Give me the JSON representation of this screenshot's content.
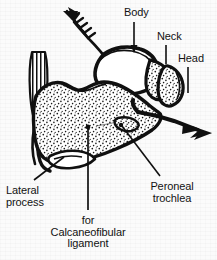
{
  "figure": {
    "background_color": "#fbfbfb",
    "ink_color": "#111111"
  },
  "labels": [
    {
      "id": "body",
      "text": "Body",
      "lines": [
        "Body"
      ],
      "x": 124,
      "y": 7,
      "points_to": "talus-body",
      "leader": "vertical-arrow-down"
    },
    {
      "id": "neck",
      "text": "Neck",
      "lines": [
        "Neck"
      ],
      "x": 157,
      "y": 31,
      "points_to": "talus-neck",
      "leader": "vertical-line-down"
    },
    {
      "id": "head",
      "text": "Head",
      "lines": [
        "Head"
      ],
      "x": 178,
      "y": 53,
      "points_to": "talus-head",
      "leader": "vertical-line-down"
    },
    {
      "id": "lateral-process",
      "text": "Lateral process",
      "lines": [
        "Lateral",
        "process"
      ],
      "x": 6,
      "y": 185,
      "points_to": "lateral-process-of-calcaneus",
      "leader": "diagonal-line-up-right"
    },
    {
      "id": "calcaneofibular",
      "text": "for Calcaneofibular ligament",
      "lines": [
        "for",
        "Calcaneofibular",
        "ligament"
      ],
      "x": 51,
      "y": 215,
      "points_to": "calcaneofibular-ligament-facet",
      "leader": "vertical-line-up-with-dot"
    },
    {
      "id": "peroneal-trochlea",
      "text": "Peroneal trochlea",
      "lines": [
        "Peroneal",
        "trochlea"
      ],
      "x": 138,
      "y": 181,
      "points_to": "peroneal-trochlea-of-calcaneus",
      "leader": "diagonal-line-up-left-with-dot"
    }
  ],
  "structures": [
    {
      "id": "achilles-tendon",
      "name": "achilles-tendon",
      "shading": "striated"
    },
    {
      "id": "calcaneus",
      "name": "calcaneus-body",
      "shading": "stippled"
    },
    {
      "id": "talus-body",
      "name": "talus-body",
      "shading": "plain-white"
    },
    {
      "id": "talus-neck",
      "name": "talus-neck",
      "shading": "stippled"
    },
    {
      "id": "talus-head",
      "name": "talus-head",
      "shading": "stippled"
    },
    {
      "id": "peroneal-trochlea-ridge",
      "name": "peroneal-trochlea",
      "shading": "stippled"
    },
    {
      "id": "lateral-process-of-calcaneus",
      "name": "lateral-process",
      "shading": "stippled"
    }
  ],
  "arrows": [
    {
      "id": "feathered-arrow",
      "name": "feathered-force-arrow",
      "direction": "up-left",
      "style": "fletched"
    },
    {
      "id": "solid-arrow",
      "name": "solid-force-arrow",
      "direction": "down-right",
      "style": "solid-barbed"
    }
  ]
}
